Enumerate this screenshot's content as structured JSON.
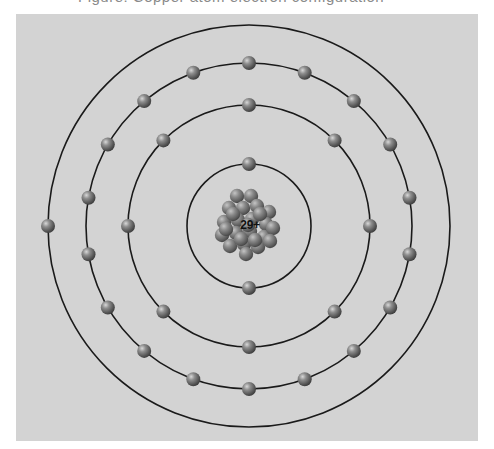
{
  "caption": {
    "text": "Figure: Copper atom electron configuration",
    "note": "cropped at top edge; only descenders visible"
  },
  "diagram": {
    "background_color": "#d3d3d3",
    "orbit_color": "#1a1a1a",
    "electron_color": "#7a7a7a",
    "center": {
      "x": 249,
      "y": 226
    },
    "nucleus": {
      "label": "29+",
      "charge": 29,
      "element": "Copper (Cu)"
    },
    "shells": [
      {
        "name": "shell-1",
        "radius": 62,
        "electrons": 2,
        "start_angle_deg": -90
      },
      {
        "name": "shell-2",
        "radius": 121,
        "electrons": 8,
        "start_angle_deg": -90
      },
      {
        "name": "shell-3",
        "radius": 163,
        "electrons": 18,
        "start_angle_deg": -90
      },
      {
        "name": "shell-4",
        "radius": 201,
        "electrons": 1,
        "start_angle_deg": 180
      }
    ],
    "electron_configuration": [
      2,
      8,
      18,
      1
    ]
  }
}
